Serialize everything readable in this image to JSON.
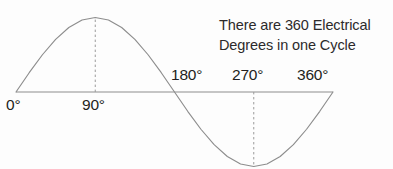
{
  "figure": {
    "title": "",
    "annotation": {
      "line1": "There are 360 Electrical",
      "line2": "Degrees in one Cycle"
    },
    "colors": {
      "curve": "#8d8d8d",
      "axis": "#8d8d8d",
      "guide": "#9a9a9a",
      "text": "#231f20",
      "background": "#fdfdfd"
    }
  },
  "chart_data": {
    "type": "line",
    "title": "",
    "xlabel": "",
    "ylabel": "",
    "xlim": [
      0,
      360
    ],
    "ylim": [
      -1,
      1
    ],
    "grid": false,
    "legend_position": "none",
    "x_tick_labels": [
      "0°",
      "90°",
      "180°",
      "270°",
      "360°"
    ],
    "x_ticks": [
      0,
      90,
      180,
      270,
      360
    ],
    "annotations": [
      "There are 360 Electrical",
      "Degrees in one Cycle"
    ],
    "guide_lines": [
      {
        "at_degrees": 90,
        "style": "dashed",
        "from_value": 0,
        "to_value": 1
      },
      {
        "at_degrees": 270,
        "style": "dashed",
        "from_value": 0,
        "to_value": -1
      }
    ],
    "series": [
      {
        "name": "sine",
        "x": [
          0,
          15,
          30,
          45,
          60,
          75,
          90,
          105,
          120,
          135,
          150,
          165,
          180,
          195,
          210,
          225,
          240,
          255,
          270,
          285,
          300,
          315,
          330,
          345,
          360
        ],
        "values": [
          0,
          0.259,
          0.5,
          0.707,
          0.866,
          0.966,
          1,
          0.966,
          0.866,
          0.707,
          0.5,
          0.259,
          0,
          -0.259,
          -0.5,
          -0.707,
          -0.866,
          -0.966,
          -1,
          -0.966,
          -0.866,
          -0.707,
          -0.5,
          -0.259,
          0
        ]
      }
    ]
  },
  "axis_labels": {
    "deg0": "0°",
    "deg90": "90°",
    "deg180": "180°",
    "deg270": "270°",
    "deg360": "360°"
  }
}
